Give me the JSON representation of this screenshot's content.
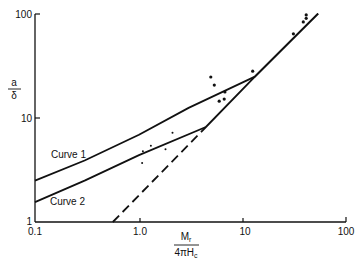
{
  "chart_data": {
    "type": "line",
    "title": "",
    "xlabel": "Mr / 4πHc",
    "ylabel": "a / δ",
    "xscale": "log",
    "yscale": "log",
    "xlim": [
      0.1,
      100
    ],
    "ylim": [
      1,
      100
    ],
    "grid": false,
    "legend": "none (curves labeled inline)",
    "x_ticks": [
      "0.1",
      "1.0",
      "10",
      "100"
    ],
    "y_ticks": [
      "1",
      "10",
      "100"
    ],
    "series": [
      {
        "name": "Curve 1",
        "style": "solid",
        "points": [
          [
            0.1,
            2.5
          ],
          [
            0.3,
            3.9
          ],
          [
            1.0,
            6.9
          ],
          [
            3.0,
            12.5
          ],
          [
            13.0,
            25.0
          ],
          [
            52.7,
            101.0
          ]
        ]
      },
      {
        "name": "Curve 2",
        "style": "solid",
        "points": [
          [
            0.1,
            1.55
          ],
          [
            0.3,
            2.5
          ],
          [
            1.0,
            4.4
          ],
          [
            4.4,
            8.2
          ],
          [
            13.0,
            25.0
          ],
          [
            52.7,
            101.0
          ]
        ]
      },
      {
        "name": "Asymptote",
        "style": "dashed",
        "points": [
          [
            0.56,
            1.0
          ],
          [
            4.4,
            8.2
          ]
        ]
      },
      {
        "name": "Measured (dots)",
        "style": "scatter",
        "points": [
          [
            1.09,
            4.8
          ],
          [
            1.3,
            5.4
          ],
          [
            1.8,
            5.0
          ],
          [
            1.07,
            3.7
          ],
          [
            2.1,
            7.2
          ],
          [
            4.9,
            24.8
          ],
          [
            5.3,
            20.7
          ],
          [
            6.7,
            17.8
          ],
          [
            5.9,
            14.5
          ],
          [
            6.6,
            15.2
          ],
          [
            12.4,
            28.2
          ],
          [
            30.5,
            64.5
          ],
          [
            38.0,
            84.0
          ],
          [
            40.5,
            98.0
          ],
          [
            40.5,
            91.0
          ]
        ]
      }
    ],
    "annotations": [
      {
        "text": "Curve 1",
        "x": 0.18,
        "y": 4.0
      },
      {
        "text": "Curve 2",
        "x": 0.18,
        "y": 1.9
      }
    ]
  },
  "labels": {
    "y_num": "a",
    "y_den": "δ",
    "x_num": "Mr",
    "x_num_main": "M",
    "x_num_sub": "r",
    "x_den_main": "4πH",
    "x_den_sub": "c",
    "curve1": "Curve 1",
    "curve2": "Curve 2",
    "xt0": "0.1",
    "xt1": "1.0",
    "xt2": "10",
    "xt3": "100",
    "yt0": "1",
    "yt1": "10",
    "yt2": "100"
  },
  "colors": {
    "ink": "#111111",
    "background": "#ffffff"
  }
}
